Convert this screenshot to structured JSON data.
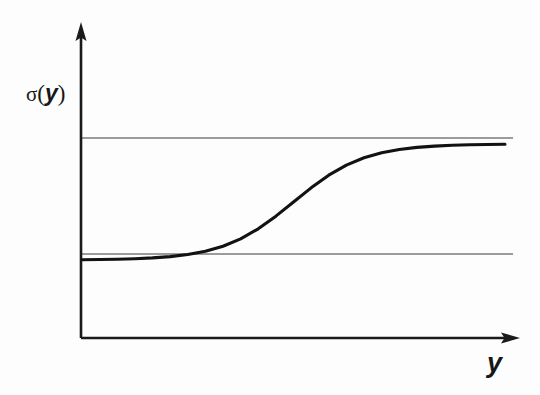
{
  "figure": {
    "background_color": "#fdfdfd",
    "ink_color": "#1a1a1a",
    "axis_color": "#1a1a1a",
    "asymptote_color": "#3a3a3a",
    "curve_color": "#121212"
  },
  "labels": {
    "y_axis": {
      "sigma": "σ",
      "open_paren": "(",
      "variable": "y",
      "close_paren": ")",
      "full_text": "σ(y)"
    },
    "x_axis": {
      "variable": "y",
      "full_text": "y"
    }
  },
  "icons": {
    "y_axis_arrow": "arrow-up-icon",
    "x_axis_arrow": "arrow-right-icon"
  },
  "chart_data": {
    "type": "line",
    "title": "",
    "subtitle": "",
    "xlabel": "y",
    "ylabel": "σ(y)",
    "grid": false,
    "legend": null,
    "legend_position": "none",
    "xlim": [
      -6,
      6
    ],
    "ylim": [
      -0.35,
      1.3
    ],
    "xticks": [],
    "yticks": [],
    "xticklabels": [],
    "yticklabels": [],
    "annotations": [
      {
        "name": "upper-asymptote",
        "type": "hline",
        "value": 1.0,
        "label": ""
      },
      {
        "name": "lower-asymptote",
        "type": "hline",
        "value": 0.0,
        "label": ""
      }
    ],
    "series": [
      {
        "name": "sigmoid",
        "function": "sigma(y) = 1 / (1 + e^(-y))",
        "x": [
          -6.0,
          -5.5,
          -5.0,
          -4.5,
          -4.0,
          -3.5,
          -3.0,
          -2.5,
          -2.0,
          -1.5,
          -1.0,
          -0.5,
          0.0,
          0.5,
          1.0,
          1.5,
          2.0,
          2.5,
          3.0,
          3.5,
          4.0,
          4.5,
          5.0,
          5.5,
          6.0
        ],
        "values": [
          0.002,
          0.004,
          0.007,
          0.011,
          0.018,
          0.029,
          0.047,
          0.076,
          0.119,
          0.182,
          0.269,
          0.378,
          0.5,
          0.622,
          0.731,
          0.818,
          0.881,
          0.924,
          0.953,
          0.971,
          0.982,
          0.989,
          0.993,
          0.996,
          0.998
        ]
      }
    ]
  },
  "geometry": {
    "origin": {
      "x": 81,
      "y": 338
    },
    "y_axis_top": {
      "x": 81,
      "y": 25
    },
    "x_axis_right": {
      "x": 518,
      "y": 338
    },
    "upper_line_y": 138,
    "lower_line_y": 254,
    "line_left_x": 81,
    "line_right_x": 513
  }
}
